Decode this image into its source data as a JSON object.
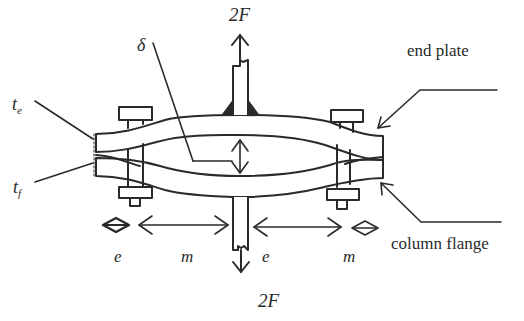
{
  "diagram": {
    "type": "T-stub end plate connection under tension",
    "labels": {
      "force_top": "2F",
      "force_bottom": "2F",
      "delta": "δ",
      "te_main": "t",
      "te_sub": "e",
      "tf_main": "t",
      "tf_sub": "f",
      "end_plate": "end plate",
      "column_flange": "column flange",
      "e_left": "e",
      "m_left": "m",
      "e_right": "e",
      "m_right": "m"
    },
    "components": [
      "end plate (upper deformed plate)",
      "column flange (lower deformed plate)",
      "bolts (2)",
      "beam web with fillet welds",
      "column web"
    ],
    "dimensions": [
      "e",
      "m",
      "e",
      "m"
    ],
    "colors": {
      "line": "#2a2a2a",
      "background": "#ffffff"
    }
  }
}
